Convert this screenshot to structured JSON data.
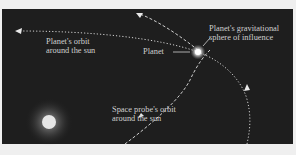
{
  "diagram": {
    "labels": {
      "planet_orbit_line1": "Planet's orbit",
      "planet_orbit_line2": "around the sun",
      "planet": "Planet",
      "sphere_line1": "Planet's gravitational",
      "sphere_line2": "sphere of influence",
      "probe_orbit_line1": "Space probe's orbit",
      "probe_orbit_line2": "around the sun"
    },
    "colors": {
      "background": "#efefef",
      "panel": "#1e1e1e",
      "lines": "#d8d8d8",
      "sun": "#ffffff",
      "text": "#cfcfcf"
    }
  }
}
